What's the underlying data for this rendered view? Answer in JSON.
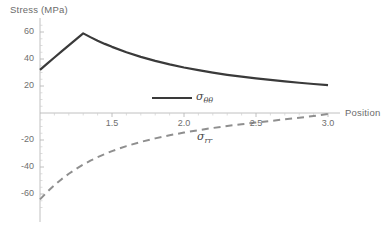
{
  "chart_data": {
    "type": "line",
    "title": "",
    "ylabel": "Stress (MPa)",
    "xlabel": "Position",
    "xlim": [
      1.0,
      3.05
    ],
    "ylim": [
      -72,
      66
    ],
    "xticks": [
      "1.5",
      "2.0",
      "2.5",
      "3.0"
    ],
    "xtick_values": [
      1.5,
      2.0,
      2.5,
      3.0
    ],
    "yticks": [
      "60",
      "40",
      "20",
      "-20",
      "-40",
      "-60"
    ],
    "ytick_values": [
      60,
      40,
      20,
      -20,
      -40,
      -60
    ],
    "grid": false,
    "legend_position": "inside-center",
    "series": [
      {
        "name": "sigma_theta_theta",
        "legend_label": "σ",
        "legend_sub": "θθ",
        "style": "solid",
        "color": "#3a3a3a",
        "width": 2.2,
        "x": [
          1.0,
          1.05,
          1.1,
          1.15,
          1.2,
          1.25,
          1.3,
          1.35,
          1.4,
          1.45,
          1.5,
          1.6,
          1.7,
          1.8,
          1.9,
          2.0,
          2.1,
          2.2,
          2.3,
          2.4,
          2.5,
          2.6,
          2.7,
          2.8,
          2.9,
          3.0
        ],
        "y": [
          32.0,
          36.6,
          41.1,
          45.6,
          50.1,
          54.6,
          59.0,
          56.2,
          53.6,
          51.2,
          49.0,
          45.0,
          41.6,
          38.6,
          36.0,
          33.7,
          31.7,
          29.9,
          28.3,
          26.9,
          25.6,
          24.5,
          23.4,
          22.4,
          21.5,
          20.6
        ]
      },
      {
        "name": "sigma_rr",
        "legend_label": "σ",
        "legend_sub": "rr",
        "style": "dashed",
        "color": "#8f8f8f",
        "width": 2.0,
        "x": [
          1.0,
          1.05,
          1.1,
          1.15,
          1.2,
          1.25,
          1.3,
          1.35,
          1.4,
          1.5,
          1.6,
          1.7,
          1.8,
          1.9,
          2.0,
          2.1,
          2.2,
          2.3,
          2.4,
          2.5,
          2.6,
          2.7,
          2.8,
          2.9,
          3.0
        ],
        "y": [
          -64.0,
          -58.5,
          -53.5,
          -49.0,
          -45.0,
          -41.4,
          -38.2,
          -35.3,
          -32.7,
          -28.2,
          -24.5,
          -21.4,
          -18.8,
          -16.5,
          -14.5,
          -12.7,
          -11.1,
          -9.6,
          -8.3,
          -7.1,
          -5.9,
          -4.7,
          -3.5,
          -2.2,
          -0.8
        ]
      }
    ]
  },
  "axes": {
    "y_axis_title": "Stress (MPa)",
    "x_axis_title": "Position"
  },
  "legend": {
    "entries": [
      {
        "label": "σθθ",
        "style": "solid"
      },
      {
        "label": "σrr",
        "style": "dashed"
      }
    ]
  }
}
